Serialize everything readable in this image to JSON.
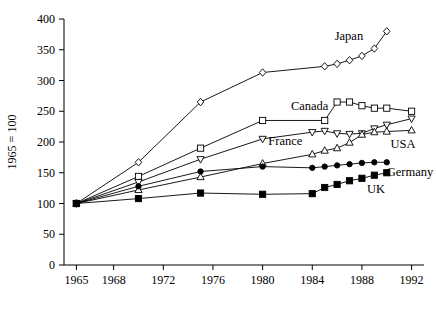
{
  "chart_data": {
    "type": "line",
    "title": "",
    "subtitle": "",
    "xlabel": "",
    "ylabel": "1965 = 100",
    "xlim": [
      1964,
      1993
    ],
    "ylim": [
      0,
      400
    ],
    "grid": false,
    "legend_position": "inline-right",
    "x_ticks": [
      1965,
      1968,
      1972,
      1976,
      1980,
      1984,
      1988,
      1992
    ],
    "y_ticks": [
      0,
      50,
      100,
      150,
      200,
      250,
      300,
      350,
      400
    ],
    "x_tick_labels": [
      "1965",
      "1968",
      "1972",
      "1976",
      "1980",
      "1984",
      "1988",
      "1992"
    ],
    "y_tick_labels": [
      "0",
      "50",
      "100",
      "150",
      "200",
      "250",
      "300",
      "350",
      "400"
    ],
    "series": [
      {
        "name": "Japan",
        "marker": "diamond-open",
        "label_x": 1988.1,
        "label_y": 372,
        "label_anchor": "end",
        "x": [
          1965,
          1970,
          1975,
          1980,
          1985,
          1986,
          1987,
          1988,
          1989,
          1990
        ],
        "y": [
          100,
          167,
          265,
          313,
          323,
          327,
          333,
          340,
          352,
          380
        ]
      },
      {
        "name": "Canada",
        "marker": "square-open",
        "label_x": 1985.3,
        "label_y": 258,
        "label_anchor": "end",
        "x": [
          1965,
          1970,
          1975,
          1980,
          1985,
          1986,
          1987,
          1988,
          1989,
          1990,
          1992
        ],
        "y": [
          100,
          144,
          190,
          235,
          235,
          265,
          265,
          259,
          255,
          255,
          250
        ]
      },
      {
        "name": "France",
        "marker": "triangle-down-open",
        "label_x": 1983.2,
        "label_y": 202,
        "label_anchor": "end",
        "x": [
          1965,
          1970,
          1975,
          1980,
          1984,
          1985,
          1986,
          1987,
          1988,
          1989,
          1990,
          1992
        ],
        "y": [
          100,
          135,
          172,
          205,
          216,
          218,
          214,
          213,
          214,
          222,
          228,
          238
        ]
      },
      {
        "name": "USA",
        "marker": "triangle-up-open",
        "label_x": 1990.3,
        "label_y": 196,
        "label_anchor": "start",
        "x": [
          1965,
          1970,
          1975,
          1980,
          1984,
          1985,
          1986,
          1987,
          1988,
          1989,
          1990,
          1992
        ],
        "y": [
          100,
          122,
          143,
          165,
          180,
          186,
          190,
          199,
          212,
          216,
          217,
          219
        ]
      },
      {
        "name": "Germany",
        "marker": "circle-filled",
        "label_x": 1990.0,
        "label_y": 152,
        "label_anchor": "start",
        "x": [
          1965,
          1970,
          1975,
          1980,
          1984,
          1985,
          1986,
          1987,
          1988,
          1989,
          1990
        ],
        "y": [
          100,
          128,
          152,
          160,
          158,
          160,
          162,
          164,
          166,
          167,
          167
        ]
      },
      {
        "name": "UK",
        "marker": "square-filled",
        "label_x": 1988.4,
        "label_y": 123,
        "label_anchor": "start",
        "x": [
          1965,
          1970,
          1975,
          1980,
          1984,
          1985,
          1986,
          1987,
          1988,
          1989,
          1990
        ],
        "y": [
          100,
          108,
          117,
          115,
          116,
          126,
          131,
          137,
          141,
          146,
          150
        ]
      }
    ]
  }
}
